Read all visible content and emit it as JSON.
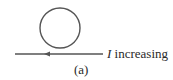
{
  "figure": {
    "current_label": {
      "symbol": "I",
      "text": " increasing"
    },
    "caption": "(a)",
    "loop": {
      "cx": 60,
      "cy": 28,
      "r": 20
    },
    "wire": {
      "x1": 15,
      "x2": 103,
      "y": 54,
      "arrow_direction": "left",
      "arrow_x": 47
    },
    "colors": {
      "stroke": "#555555",
      "text": "#2a2a2a",
      "background": "#ffffff"
    }
  }
}
